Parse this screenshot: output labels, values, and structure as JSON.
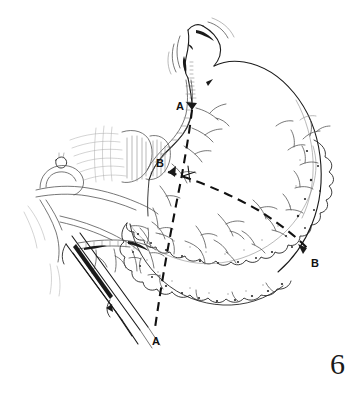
{
  "figure": {
    "number": "6",
    "domain": "medical-surgical-line-illustration",
    "background_color": "#ffffff",
    "ink_color": "#1a1a1a",
    "light_ink_color": "#555555",
    "faint_ink_color": "#8a8a8a"
  },
  "labels": [
    {
      "id": "label-a-top",
      "text": "A",
      "x": 176,
      "y": 101
    },
    {
      "id": "label-b-left",
      "text": "B",
      "x": 156,
      "y": 158
    },
    {
      "id": "label-b-right",
      "text": "B",
      "x": 311,
      "y": 258
    },
    {
      "id": "label-a-bottom",
      "text": "A",
      "x": 152,
      "y": 336
    }
  ],
  "resection_lines": [
    {
      "id": "line-a-a",
      "name": "A-A resection line",
      "style": "dashed",
      "from_label": "A",
      "to_label": "A",
      "points": [
        [
          192,
          110
        ],
        [
          190,
          128
        ],
        [
          186,
          152
        ],
        [
          181,
          180
        ],
        [
          172,
          225
        ],
        [
          163,
          272
        ],
        [
          157,
          305
        ],
        [
          155,
          328
        ]
      ]
    },
    {
      "id": "line-b-b",
      "name": "B-B resection line",
      "style": "dashed",
      "from_label": "B",
      "to_label": "B",
      "points": [
        [
          168,
          172
        ],
        [
          196,
          180
        ],
        [
          228,
          193
        ],
        [
          258,
          210
        ],
        [
          283,
          226
        ],
        [
          300,
          240
        ],
        [
          307,
          248
        ]
      ]
    }
  ],
  "anatomy": {
    "organ": "stomach",
    "parts": [
      "esophagus",
      "cardia",
      "fundus",
      "body",
      "lesser-curvature",
      "greater-curvature",
      "greater-omentum",
      "left-gastric-artery",
      "splenic-artery",
      "common-hepatic-artery",
      "celiac-trunk",
      "gastroepiploic-vessels",
      "vagus-nerve-branches"
    ],
    "instrument": "surgical-clamp"
  }
}
